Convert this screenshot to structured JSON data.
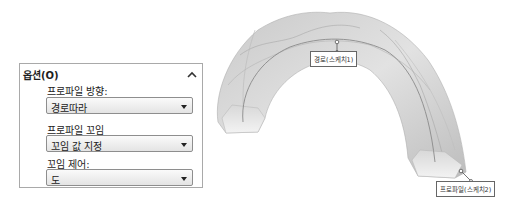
{
  "options_panel": {
    "title": "옵션(O)",
    "collapse_icon": "chevron-up-icon",
    "fields": [
      {
        "label": "프로파일 방향:",
        "value": "경로따라"
      },
      {
        "label": "프로파일 꼬임",
        "value": "꼬임 값 지정"
      },
      {
        "label": "꼬임 제어:",
        "value": "도"
      }
    ]
  },
  "viewport": {
    "callouts": [
      {
        "label": "경로(스케치1)"
      },
      {
        "label": "프로파일(스케치2)"
      }
    ]
  }
}
